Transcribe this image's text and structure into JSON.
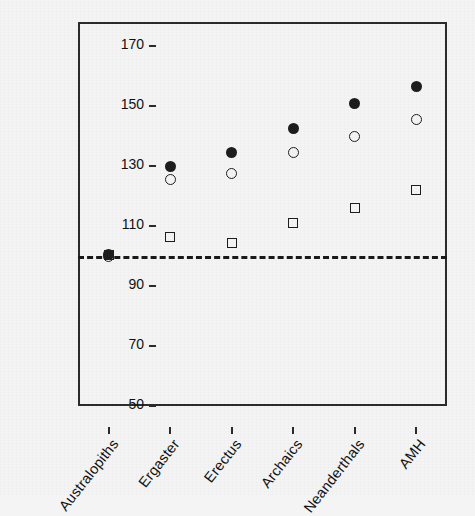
{
  "chart_data": {
    "type": "scatter",
    "title": "",
    "subtitle": "",
    "xlabel": "",
    "ylabel": "Total time budget (%)",
    "categories": [
      "Australopiths",
      "Ergaster",
      "Erectus",
      "Archaics",
      "Neanderthals",
      "AMH"
    ],
    "ylim": [
      50,
      178
    ],
    "yticks": [
      50,
      70,
      90,
      110,
      130,
      150,
      170
    ],
    "ytick_labels": [
      "50",
      "70",
      "90",
      "110",
      "130",
      "150",
      "170"
    ],
    "grid": false,
    "legend": "none",
    "series": [
      {
        "name": "filled-circle",
        "marker": "filled-circle",
        "color": "#1d1d1d",
        "values": [
          100.5,
          130.0,
          134.5,
          142.5,
          151.0,
          156.5
        ]
      },
      {
        "name": "open-circle",
        "marker": "open-circle",
        "color": "#1d1d1d",
        "values": [
          100.0,
          125.5,
          127.5,
          134.5,
          140.0,
          145.5
        ]
      },
      {
        "name": "open-square",
        "marker": "open-square",
        "color": "#1d1d1d",
        "values": [
          100.5,
          106.5,
          104.5,
          111.0,
          116.0,
          122.0
        ]
      }
    ],
    "annotations": [
      {
        "name": "reference-line",
        "type": "hline",
        "value": 100,
        "style": "dashed",
        "color": "#191919"
      }
    ]
  },
  "axis": {
    "frame_color": "#2b2b2b",
    "tick_color": "#2b2b2b",
    "label_color": "#111111"
  },
  "figure": {
    "background": "#f4f4f4"
  }
}
